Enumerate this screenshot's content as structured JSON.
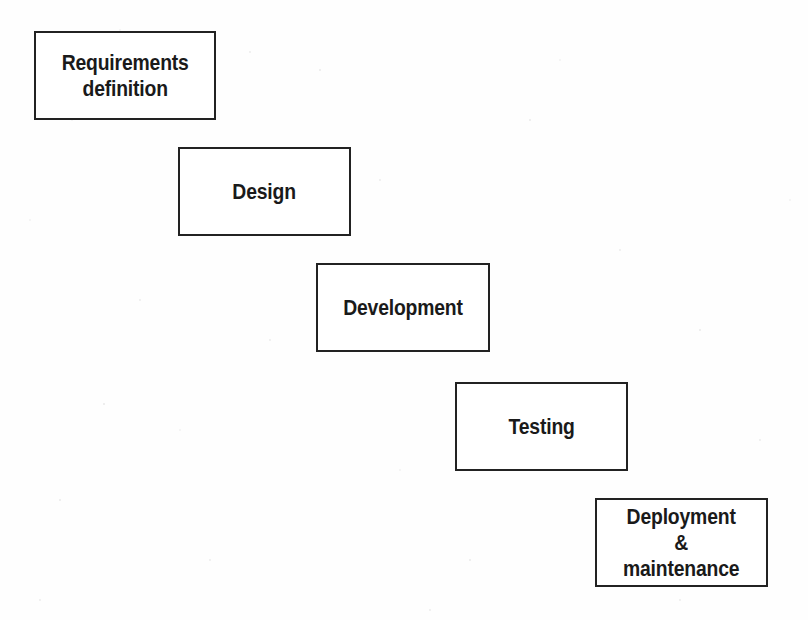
{
  "diagram": {
    "type": "waterfall-model",
    "background_color": "#fefefe",
    "box_border_color": "#222222",
    "text_color": "#1a1a1a",
    "stages": [
      {
        "id": "requirements-definition",
        "label": "Requirements\ndefinition",
        "order": 1,
        "x": 34,
        "y": 31,
        "width": 182,
        "height": 89
      },
      {
        "id": "design",
        "label": "Design",
        "order": 2,
        "x": 178,
        "y": 147,
        "width": 173,
        "height": 89
      },
      {
        "id": "development",
        "label": "Development",
        "order": 3,
        "x": 316,
        "y": 263,
        "width": 174,
        "height": 89
      },
      {
        "id": "testing",
        "label": "Testing",
        "order": 4,
        "x": 455,
        "y": 382,
        "width": 173,
        "height": 89
      },
      {
        "id": "deployment-and-maintenance",
        "label": "Deployment\n&\nmaintenance",
        "order": 5,
        "x": 595,
        "y": 498,
        "width": 173,
        "height": 89
      }
    ]
  }
}
